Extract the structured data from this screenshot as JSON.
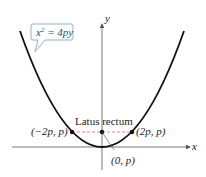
{
  "diagram": {
    "equation_label": "x² = 4py",
    "equation_parts": {
      "base": "x",
      "exp": "2",
      "rhs": " = 4py"
    },
    "axis_labels": {
      "x": "x",
      "y": "y"
    },
    "latus_rectum_label": "Latus rectum",
    "points": [
      {
        "label": "(−2p, p)",
        "role": "left-endpoint"
      },
      {
        "label": "(0, p)",
        "role": "focus"
      },
      {
        "label": "(2p, p)",
        "role": "right-endpoint"
      }
    ],
    "colors": {
      "curve": "#111111",
      "axis": "#555555",
      "latus_dash": "#e07a6a",
      "callout_border": "#8fb3cc",
      "callout_text": "#2a4d6a"
    }
  }
}
